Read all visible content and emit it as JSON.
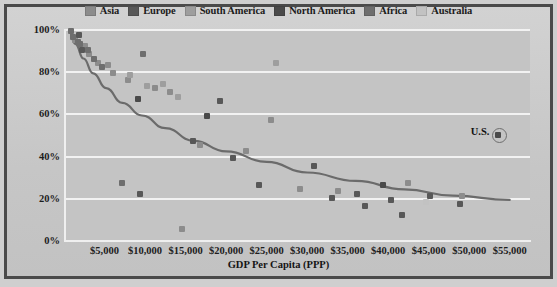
{
  "chart_data": {
    "type": "scatter",
    "title": "",
    "xlabel": "GDP Per Capita (PPP)",
    "ylabel": "Percentage saying religion plays a “very important” role in their lives",
    "ylabel_line1": "Percentage saying religion plays a",
    "ylabel_line2": "“very important” role in their lives",
    "xlim": [
      0,
      57500
    ],
    "ylim": [
      0,
      100
    ],
    "grid": true,
    "legend_position": "top-center",
    "xticks": [
      "$5,000",
      "$10,000",
      "$15,000",
      "$20,000",
      "$25,000",
      "$30,000",
      "$35,000",
      "$40,000",
      "$45,000",
      "$50,000",
      "$55,000"
    ],
    "xtick_values": [
      5000,
      10000,
      15000,
      20000,
      25000,
      30000,
      35000,
      40000,
      45000,
      50000,
      55000
    ],
    "yticks": [
      "0%",
      "20%",
      "40%",
      "60%",
      "80%",
      "100%"
    ],
    "ytick_values": [
      0,
      20,
      40,
      60,
      80,
      100
    ],
    "series": [
      {
        "name": "Asia",
        "color": "#8c8c8c",
        "points": [
          {
            "x": 1400,
            "y": 95
          },
          {
            "x": 2600,
            "y": 92
          },
          {
            "x": 3100,
            "y": 88
          },
          {
            "x": 4200,
            "y": 84
          },
          {
            "x": 5400,
            "y": 83
          },
          {
            "x": 6100,
            "y": 79
          },
          {
            "x": 7900,
            "y": 76
          },
          {
            "x": 11200,
            "y": 72
          },
          {
            "x": 13100,
            "y": 70
          },
          {
            "x": 14600,
            "y": 5
          },
          {
            "x": 16800,
            "y": 45
          },
          {
            "x": 22400,
            "y": 42
          },
          {
            "x": 25600,
            "y": 57
          },
          {
            "x": 29100,
            "y": 24
          },
          {
            "x": 33800,
            "y": 23
          },
          {
            "x": 42400,
            "y": 27
          },
          {
            "x": 49100,
            "y": 21
          }
        ]
      },
      {
        "name": "Europe",
        "color": "#585858",
        "points": [
          {
            "x": 1900,
            "y": 97
          },
          {
            "x": 2200,
            "y": 90
          },
          {
            "x": 9400,
            "y": 22
          },
          {
            "x": 15900,
            "y": 47
          },
          {
            "x": 19200,
            "y": 66
          },
          {
            "x": 20900,
            "y": 39
          },
          {
            "x": 24100,
            "y": 26
          },
          {
            "x": 30900,
            "y": 35
          },
          {
            "x": 33100,
            "y": 20
          },
          {
            "x": 36100,
            "y": 22
          },
          {
            "x": 37200,
            "y": 16
          },
          {
            "x": 40300,
            "y": 19
          },
          {
            "x": 41700,
            "y": 12
          },
          {
            "x": 45200,
            "y": 21
          },
          {
            "x": 48900,
            "y": 17
          }
        ]
      },
      {
        "name": "South America",
        "color": "#9e9e9e",
        "points": [
          {
            "x": 8100,
            "y": 78
          },
          {
            "x": 10300,
            "y": 73
          },
          {
            "x": 12200,
            "y": 74
          },
          {
            "x": 14100,
            "y": 68
          },
          {
            "x": 26200,
            "y": 84
          }
        ]
      },
      {
        "name": "North America",
        "color": "#4a4a4a",
        "points": [
          {
            "x": 9100,
            "y": 67
          },
          {
            "x": 17600,
            "y": 59
          },
          {
            "x": 39300,
            "y": 26
          },
          {
            "x": 53600,
            "y": 50
          }
        ]
      },
      {
        "name": "Africa",
        "color": "#6e6e6e",
        "points": [
          {
            "x": 900,
            "y": 99
          },
          {
            "x": 1100,
            "y": 96
          },
          {
            "x": 1700,
            "y": 94
          },
          {
            "x": 2000,
            "y": 93
          },
          {
            "x": 2900,
            "y": 90
          },
          {
            "x": 3700,
            "y": 86
          },
          {
            "x": 4700,
            "y": 82
          },
          {
            "x": 7200,
            "y": 27
          },
          {
            "x": 9800,
            "y": 88
          }
        ]
      },
      {
        "name": "Australia",
        "color": "#c2c2c2",
        "points": [
          {
            "x": 44700,
            "y": 18
          }
        ]
      }
    ],
    "trend_line": {
      "name": "logarithmic fit",
      "color": "#6b6b6b",
      "points": [
        {
          "x": 600,
          "y": 99
        },
        {
          "x": 1400,
          "y": 93
        },
        {
          "x": 2400,
          "y": 86
        },
        {
          "x": 3600,
          "y": 79
        },
        {
          "x": 5200,
          "y": 72
        },
        {
          "x": 7200,
          "y": 65
        },
        {
          "x": 9600,
          "y": 59
        },
        {
          "x": 12500,
          "y": 53
        },
        {
          "x": 16000,
          "y": 47
        },
        {
          "x": 20000,
          "y": 42
        },
        {
          "x": 25000,
          "y": 37
        },
        {
          "x": 30000,
          "y": 32
        },
        {
          "x": 36000,
          "y": 28
        },
        {
          "x": 42000,
          "y": 24
        },
        {
          "x": 48000,
          "y": 21
        },
        {
          "x": 55000,
          "y": 19
        }
      ]
    },
    "annotations": [
      {
        "label": "U.S.",
        "x": 53600,
        "y": 50,
        "marker": "circled"
      }
    ]
  },
  "legend": {
    "items": [
      {
        "label": "Asia",
        "color": "#8c8c8c"
      },
      {
        "label": "Europe",
        "color": "#585858"
      },
      {
        "label": "South America",
        "color": "#9e9e9e"
      },
      {
        "label": "North America",
        "color": "#4a4a4a"
      },
      {
        "label": "Africa",
        "color": "#6e6e6e"
      },
      {
        "label": "Australia",
        "color": "#c2c2c2"
      }
    ]
  }
}
